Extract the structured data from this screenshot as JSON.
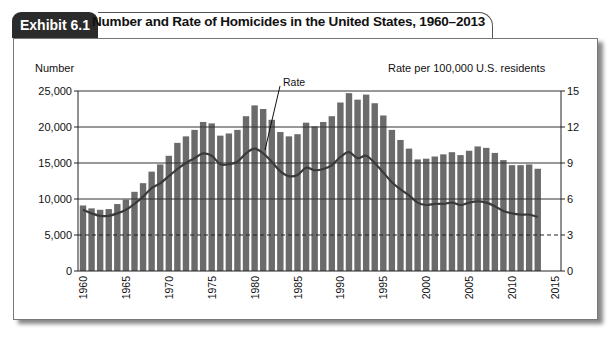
{
  "header": {
    "exhibit_label": "Exhibit 6.1",
    "title": "Number and Rate of Homicides in the United States, 1960–2013"
  },
  "colors": {
    "bar": "#6b6b6b",
    "line": "#3a3a3a",
    "tab_bg": "#2b2b2b"
  },
  "chart_data": {
    "type": "bar+line",
    "title": "Number and Rate of Homicides in the United States, 1960–2013",
    "ylabel_left": "Number",
    "ylabel_right": "Rate per 100,000 U.S. residents",
    "line_annotation": "Rate",
    "ylim_left": [
      0,
      25000
    ],
    "ylim_right": [
      0,
      15
    ],
    "yticks_left": [
      "0",
      "5,000",
      "10,000",
      "15,000",
      "20,000",
      "25,000"
    ],
    "yticks_right": [
      "0",
      "3",
      "6",
      "9",
      "12",
      "15"
    ],
    "xticks": [
      "1960",
      "1965",
      "1970",
      "1975",
      "1980",
      "1985",
      "1990",
      "1995",
      "2000",
      "2005",
      "2010",
      "2015"
    ],
    "grid": "horizontal solid lines at 10,000/15,000/20,000/25,000; dashed at 5,000 and where bars overlap",
    "years": [
      1960,
      1961,
      1962,
      1963,
      1964,
      1965,
      1966,
      1967,
      1968,
      1969,
      1970,
      1971,
      1972,
      1973,
      1974,
      1975,
      1976,
      1977,
      1978,
      1979,
      1980,
      1981,
      1982,
      1983,
      1984,
      1985,
      1986,
      1987,
      1988,
      1989,
      1990,
      1991,
      1992,
      1993,
      1994,
      1995,
      1996,
      1997,
      1998,
      1999,
      2000,
      2001,
      2002,
      2003,
      2004,
      2005,
      2006,
      2007,
      2008,
      2009,
      2010,
      2011,
      2012,
      2013
    ],
    "series": [
      {
        "name": "Number",
        "axis": "left",
        "type": "bar",
        "values": [
          9100,
          8700,
          8500,
          8600,
          9300,
          9900,
          11000,
          12200,
          13800,
          14800,
          16000,
          17800,
          18700,
          19600,
          20700,
          20500,
          18800,
          19100,
          19600,
          21500,
          23000,
          22500,
          21000,
          19300,
          18700,
          19000,
          20600,
          20100,
          20700,
          21500,
          23400,
          24700,
          23800,
          24500,
          23300,
          21600,
          19600,
          18200,
          17000,
          15500,
          15600,
          15900,
          16200,
          16500,
          16100,
          16700,
          17300,
          17100,
          16400,
          15400,
          14700,
          14700,
          14800,
          14200
        ]
      },
      {
        "name": "Rate",
        "axis": "right",
        "type": "line",
        "values": [
          5.1,
          4.8,
          4.6,
          4.6,
          4.8,
          5.1,
          5.6,
          6.2,
          6.9,
          7.3,
          7.9,
          8.5,
          9.0,
          9.4,
          9.8,
          9.6,
          8.9,
          8.9,
          9.1,
          9.8,
          10.2,
          9.8,
          9.1,
          8.3,
          7.9,
          8.0,
          8.6,
          8.4,
          8.5,
          8.8,
          9.5,
          9.9,
          9.4,
          9.6,
          9.0,
          8.2,
          7.4,
          6.8,
          6.3,
          5.7,
          5.5,
          5.6,
          5.6,
          5.7,
          5.5,
          5.7,
          5.8,
          5.7,
          5.4,
          5.0,
          4.8,
          4.7,
          4.7,
          4.5
        ]
      }
    ]
  }
}
